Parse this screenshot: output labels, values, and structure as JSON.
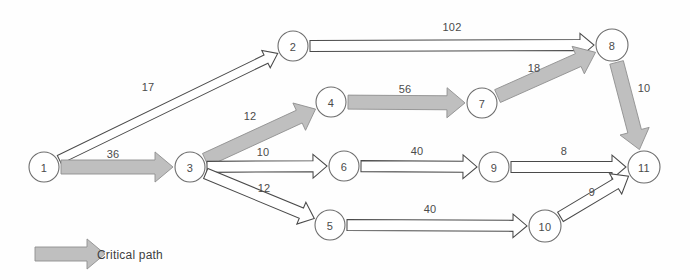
{
  "diagram": {
    "type": "activity-network-diagram",
    "canvas": {
      "width": 690,
      "height": 280
    },
    "nodes": [
      {
        "id": "1",
        "label": "1",
        "cx": 44,
        "cy": 167,
        "r": 15
      },
      {
        "id": "2",
        "label": "2",
        "cx": 293,
        "cy": 46,
        "r": 15
      },
      {
        "id": "3",
        "label": "3",
        "cx": 190,
        "cy": 167,
        "r": 15
      },
      {
        "id": "4",
        "label": "4",
        "cx": 331,
        "cy": 102,
        "r": 15
      },
      {
        "id": "5",
        "label": "5",
        "cx": 330,
        "cy": 225,
        "r": 15
      },
      {
        "id": "6",
        "label": "6",
        "cx": 344,
        "cy": 166,
        "r": 15
      },
      {
        "id": "7",
        "label": "7",
        "cx": 482,
        "cy": 103,
        "r": 15
      },
      {
        "id": "8",
        "label": "8",
        "cx": 612,
        "cy": 45,
        "r": 16
      },
      {
        "id": "9",
        "label": "9",
        "cx": 494,
        "cy": 167,
        "r": 15
      },
      {
        "id": "10",
        "label": "10",
        "cx": 545,
        "cy": 226,
        "r": 16
      },
      {
        "id": "11",
        "label": "11",
        "cx": 644,
        "cy": 167,
        "r": 16
      }
    ],
    "edges": [
      {
        "from": "1",
        "to": "2",
        "label": "17",
        "critical": false,
        "lx": 148,
        "ly": 91,
        "w": 9,
        "head": 13
      },
      {
        "from": "1",
        "to": "3",
        "label": "36",
        "critical": true,
        "lx": 113,
        "ly": 158,
        "w": 14,
        "head": 18
      },
      {
        "from": "2",
        "to": "8",
        "label": "102",
        "critical": false,
        "lx": 452,
        "ly": 31,
        "w": 11,
        "head": 14
      },
      {
        "from": "3",
        "to": "4",
        "label": "12",
        "critical": true,
        "lx": 250,
        "ly": 120,
        "w": 14,
        "head": 18
      },
      {
        "from": "3",
        "to": "6",
        "label": "10",
        "critical": false,
        "lx": 263,
        "ly": 156,
        "w": 11,
        "head": 14
      },
      {
        "from": "3",
        "to": "5",
        "label": "12",
        "critical": false,
        "lx": 264,
        "ly": 192,
        "w": 11,
        "head": 14
      },
      {
        "from": "4",
        "to": "7",
        "label": "56",
        "critical": true,
        "lx": 405,
        "ly": 93,
        "w": 14,
        "head": 18
      },
      {
        "from": "7",
        "to": "8",
        "label": "18",
        "critical": true,
        "lx": 534,
        "ly": 72,
        "w": 14,
        "head": 19
      },
      {
        "from": "8",
        "to": "11",
        "label": "10",
        "critical": true,
        "lx": 644,
        "ly": 92,
        "w": 14,
        "head": 19
      },
      {
        "from": "6",
        "to": "9",
        "label": "40",
        "critical": false,
        "lx": 417,
        "ly": 155,
        "w": 11,
        "head": 14
      },
      {
        "from": "9",
        "to": "11",
        "label": "8",
        "critical": false,
        "lx": 564,
        "ly": 155,
        "w": 11,
        "head": 14
      },
      {
        "from": "5",
        "to": "10",
        "label": "40",
        "critical": false,
        "lx": 430,
        "ly": 213,
        "w": 11,
        "head": 14
      },
      {
        "from": "10",
        "to": "11",
        "label": "9",
        "critical": false,
        "lx": 592,
        "ly": 196,
        "w": 11,
        "head": 15
      }
    ],
    "legend": {
      "label": "Critical path",
      "swatch_name": "critical-path-arrow-swatch",
      "x": 35,
      "y": 254,
      "arrow_length": 70,
      "arrow_width": 14,
      "arrow_head": 18,
      "text_x": 97
    },
    "colors": {
      "critical_fill": "#bfbfbf",
      "critical_stroke": "#8e8e8e",
      "normal_fill": "#ffffff",
      "normal_stroke": "#4a4a4a",
      "node_stroke": "#6e6e6e",
      "text": "#4b4b4b",
      "background": "#ffffff"
    }
  }
}
